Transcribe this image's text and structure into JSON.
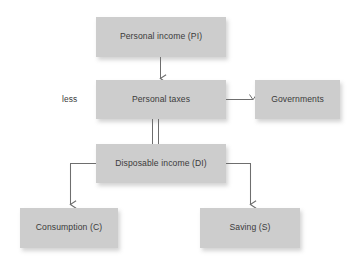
{
  "diagram": {
    "background_color": "#ffffff",
    "node_fill_color": "#cdcdcd",
    "text_color": "#3b3b3b",
    "connector_color": "#6e6e6e",
    "nodes": [
      {
        "id": "personal-income",
        "label": "Personal income (PI)"
      },
      {
        "id": "personal-taxes",
        "label": "Personal taxes"
      },
      {
        "id": "governments",
        "label": "Governments"
      },
      {
        "id": "disposable-income",
        "label": "Disposable income (DI)"
      },
      {
        "id": "consumption",
        "label": "Consumption (C)"
      },
      {
        "id": "saving",
        "label": "Saving (S)"
      }
    ],
    "captions": [
      {
        "id": "less",
        "label": "less"
      }
    ],
    "connectors": [
      {
        "id": "pi-to-taxes",
        "from": "personal-income",
        "to": "personal-taxes",
        "style": "single-arrow",
        "direction": "down"
      },
      {
        "id": "taxes-to-governments",
        "from": "personal-taxes",
        "to": "governments",
        "style": "single-arrow",
        "direction": "right"
      },
      {
        "id": "taxes-to-disposable",
        "from": "personal-taxes",
        "to": "disposable-income",
        "style": "double-line",
        "direction": "down"
      },
      {
        "id": "disposable-to-consumption",
        "from": "disposable-income",
        "to": "consumption",
        "style": "elbow-arrow",
        "direction": "left-down"
      },
      {
        "id": "disposable-to-saving",
        "from": "disposable-income",
        "to": "saving",
        "style": "elbow-arrow",
        "direction": "right-down"
      }
    ]
  }
}
